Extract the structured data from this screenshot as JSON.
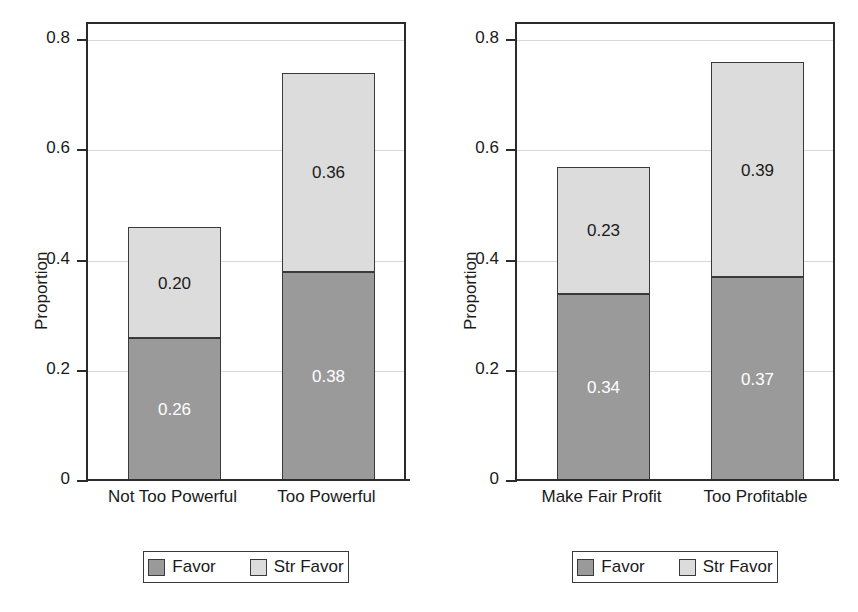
{
  "chart_data": [
    {
      "type": "bar",
      "panel": "left",
      "title": "",
      "xlabel": "",
      "ylabel": "Proportion",
      "ylim": [
        0,
        0.83
      ],
      "yticks": [
        0,
        0.2,
        0.4,
        0.6,
        0.8
      ],
      "ytick_labels": [
        "0",
        "0.2",
        "0.4",
        "0.6",
        "0.8"
      ],
      "grid": true,
      "stacked": true,
      "categories": [
        "Not Too Powerful",
        "Too Powerful"
      ],
      "series": [
        {
          "name": "Favor",
          "values": [
            0.26,
            0.38
          ],
          "labels": [
            "0.26",
            "0.38"
          ],
          "color": "#9a9a9a",
          "label_color": "#ffffff"
        },
        {
          "name": "Str Favor",
          "values": [
            0.2,
            0.36
          ],
          "labels": [
            "0.20",
            "0.36"
          ],
          "color": "#dcdcdc",
          "label_color": "#1a1a1a"
        }
      ],
      "totals": [
        0.46,
        0.74
      ],
      "legend": {
        "position": "below",
        "entries": [
          "Favor",
          "Str Favor"
        ]
      }
    },
    {
      "type": "bar",
      "panel": "right",
      "title": "",
      "xlabel": "",
      "ylabel": "Proportion",
      "ylim": [
        0,
        0.83
      ],
      "yticks": [
        0,
        0.2,
        0.4,
        0.6,
        0.8
      ],
      "ytick_labels": [
        "0",
        "0.2",
        "0.4",
        "0.6",
        "0.8"
      ],
      "grid": true,
      "stacked": true,
      "categories": [
        "Make Fair Profit",
        "Too Profitable"
      ],
      "series": [
        {
          "name": "Favor",
          "values": [
            0.34,
            0.37
          ],
          "labels": [
            "0.34",
            "0.37"
          ],
          "color": "#9a9a9a",
          "label_color": "#ffffff"
        },
        {
          "name": "Str Favor",
          "values": [
            0.23,
            0.39
          ],
          "labels": [
            "0.23",
            "0.39"
          ],
          "color": "#dcdcdc",
          "label_color": "#1a1a1a"
        }
      ],
      "totals": [
        0.56,
        0.76
      ],
      "legend": {
        "position": "below",
        "entries": [
          "Favor",
          "Str Favor"
        ]
      }
    }
  ],
  "colors": {
    "favor": "#9a9a9a",
    "str_favor": "#dcdcdc",
    "axis": "#2b2b2b",
    "grid": "#d8d8d8",
    "background": "#ffffff"
  }
}
